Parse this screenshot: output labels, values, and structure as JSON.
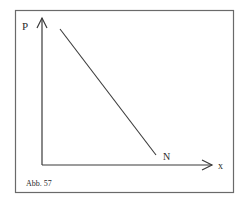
{
  "figure": {
    "caption": "Abb. 57",
    "y_axis_label": "P",
    "x_axis_label": "x",
    "line_end_label": "N",
    "colors": {
      "stroke": "#3a3a3a",
      "frame": "#6a6a6a",
      "background": "#ffffff"
    }
  },
  "diagram": {
    "type": "line-graph",
    "elements": [
      {
        "kind": "frame"
      },
      {
        "kind": "axis",
        "name": "y",
        "label": "P"
      },
      {
        "kind": "axis",
        "name": "x",
        "label": "x"
      },
      {
        "kind": "line",
        "description": "straight descending line from upper-left near P-axis to lower point labeled N above x-axis",
        "end_label": "N"
      }
    ]
  }
}
